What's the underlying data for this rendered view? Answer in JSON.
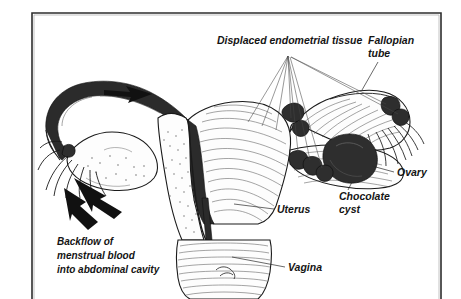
{
  "figure": {
    "title_visible": false,
    "background_color": "#ffffff",
    "ink_color": "#1a1a1a",
    "lesion_color": "#2e2e2e",
    "frame": {
      "present": true,
      "sides": "left-top-right",
      "color": "#2e2e2e"
    }
  },
  "labels": {
    "displaced_tissue": "Displaced endometrial tissue",
    "fallopian_tube_line1": "Fallopian",
    "fallopian_tube_line2": "tube",
    "ovary": "Ovary",
    "chocolate_cyst_line1": "Chocolate",
    "chocolate_cyst_line2": "cyst",
    "uterus": "Uterus",
    "vagina": "Vagina",
    "backflow_line1": "Backflow of",
    "backflow_line2": "menstrual blood",
    "backflow_line3": "into abdominal cavity"
  },
  "icons": {
    "arrow_down_left": "arrow-icon",
    "arrow_down_right": "arrow-icon",
    "tube_flow_arrow": "arrow-icon"
  },
  "structures": [
    {
      "name": "fallopian-tube-left",
      "side": "left"
    },
    {
      "name": "ovary-left",
      "side": "left"
    },
    {
      "name": "fimbriae-left",
      "side": "left"
    },
    {
      "name": "uterus-body",
      "side": "center"
    },
    {
      "name": "endometrial-cavity",
      "side": "center"
    },
    {
      "name": "cervix",
      "side": "center"
    },
    {
      "name": "vagina",
      "side": "center"
    },
    {
      "name": "fallopian-tube-right",
      "side": "right"
    },
    {
      "name": "ovary-right",
      "side": "right"
    },
    {
      "name": "fimbriae-right",
      "side": "right"
    },
    {
      "name": "chocolate-cyst",
      "side": "right"
    },
    {
      "name": "endometrial-implants",
      "side": "right",
      "count": 6
    }
  ]
}
